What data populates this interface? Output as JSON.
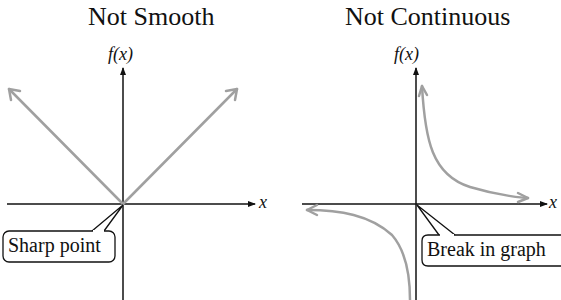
{
  "panels": [
    {
      "title": "Not Smooth",
      "y_axis_label": "f(x)",
      "x_axis_label": "x",
      "callout": "Sharp point",
      "curve": "absolute-value V shape with corner at origin"
    },
    {
      "title": "Not Continuous",
      "y_axis_label": "f(x)",
      "x_axis_label": "x",
      "callout": "Break in graph",
      "curve": "reciprocal hyperbola with break at origin"
    }
  ],
  "colors": {
    "axis": "#111111",
    "curve": "#a0a0a0",
    "callout_border": "#111111"
  }
}
